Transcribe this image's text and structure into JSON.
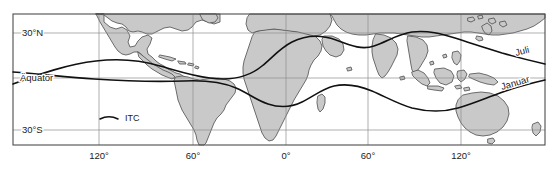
{
  "figure": {
    "type": "world-map",
    "title": ""
  },
  "colors": {
    "land_fill": "#c9c9c9",
    "land_stroke": "#4d4d4d",
    "graticule": "#8c8c8c",
    "frame": "#4d4d4d",
    "itc_line": "#111111",
    "background": "#ffffff",
    "text": "#1a1a1a"
  },
  "latitude_labels": [
    {
      "id": "lat-30n",
      "text": "30°N",
      "value": 30,
      "y": 33
    },
    {
      "id": "lat-equator",
      "text": "Äquator",
      "value": 0,
      "y": 78
    },
    {
      "id": "lat-30s",
      "text": "30°S",
      "value": -30,
      "y": 130
    }
  ],
  "longitude_labels": [
    {
      "id": "lon-120w",
      "text": "120°",
      "value": -120,
      "x": 99
    },
    {
      "id": "lon-60w",
      "text": "60°",
      "value": -60,
      "x": 193
    },
    {
      "id": "lon-0",
      "text": "0°",
      "value": 0,
      "x": 286
    },
    {
      "id": "lon-60e",
      "text": "60°",
      "value": 60,
      "x": 368
    },
    {
      "id": "lon-120e",
      "text": "120°",
      "value": 120,
      "x": 461
    }
  ],
  "itc_curves": [
    {
      "id": "itc-juli",
      "label": "Juli",
      "season": "July"
    },
    {
      "id": "itc-januar",
      "label": "Januar",
      "season": "January"
    }
  ],
  "legend": {
    "id": "legend-itc",
    "label": "ITC",
    "sample_style": "curved-line"
  }
}
